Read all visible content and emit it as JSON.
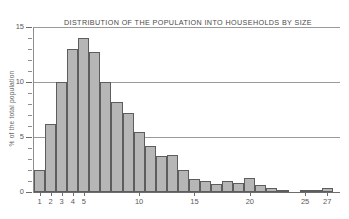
{
  "chart_data": {
    "type": "bar",
    "title": "DISTRIBUTION OF THE POPULATION INTO HOUSEHOLDS BY SIZE",
    "xlabel": "",
    "ylabel": "% of the total population",
    "ylim": [
      0,
      15
    ],
    "xlim": [
      0.5,
      27.5
    ],
    "grid": true,
    "legend": null,
    "y_ticks_major": [
      0,
      5,
      10,
      15
    ],
    "y_tick_labels": [
      "0",
      "5",
      "10",
      "15"
    ],
    "y_tick_minor_step": 1,
    "x_tick_labels": [
      "1",
      "2",
      "3",
      "4",
      "5",
      "10",
      "15",
      "20",
      "25",
      "27"
    ],
    "x_tick_values": [
      1,
      2,
      3,
      4,
      5,
      10,
      15,
      20,
      25,
      27
    ],
    "categories": [
      1,
      2,
      3,
      4,
      5,
      6,
      7,
      8,
      9,
      10,
      11,
      12,
      13,
      14,
      15,
      16,
      17,
      18,
      19,
      20,
      21,
      22,
      23,
      24,
      25,
      26,
      27
    ],
    "values": [
      2.0,
      6.2,
      10.0,
      13.0,
      14.0,
      12.7,
      10.0,
      8.2,
      7.2,
      5.5,
      4.2,
      3.3,
      3.4,
      2.0,
      1.2,
      1.0,
      0.7,
      1.0,
      0.8,
      1.3,
      0.6,
      0.4,
      0.1,
      0.0,
      0.2,
      0.1,
      0.4
    ],
    "bar_fill_color": "#b6b6b6",
    "bar_edge_color": "#5d5d5d",
    "grid_color": "#9a9a9a",
    "axis_color": "#6d6d6d",
    "text_color": "#5a5a5a",
    "title_color": "#4a4a4a",
    "background_color": "#ffffff"
  }
}
